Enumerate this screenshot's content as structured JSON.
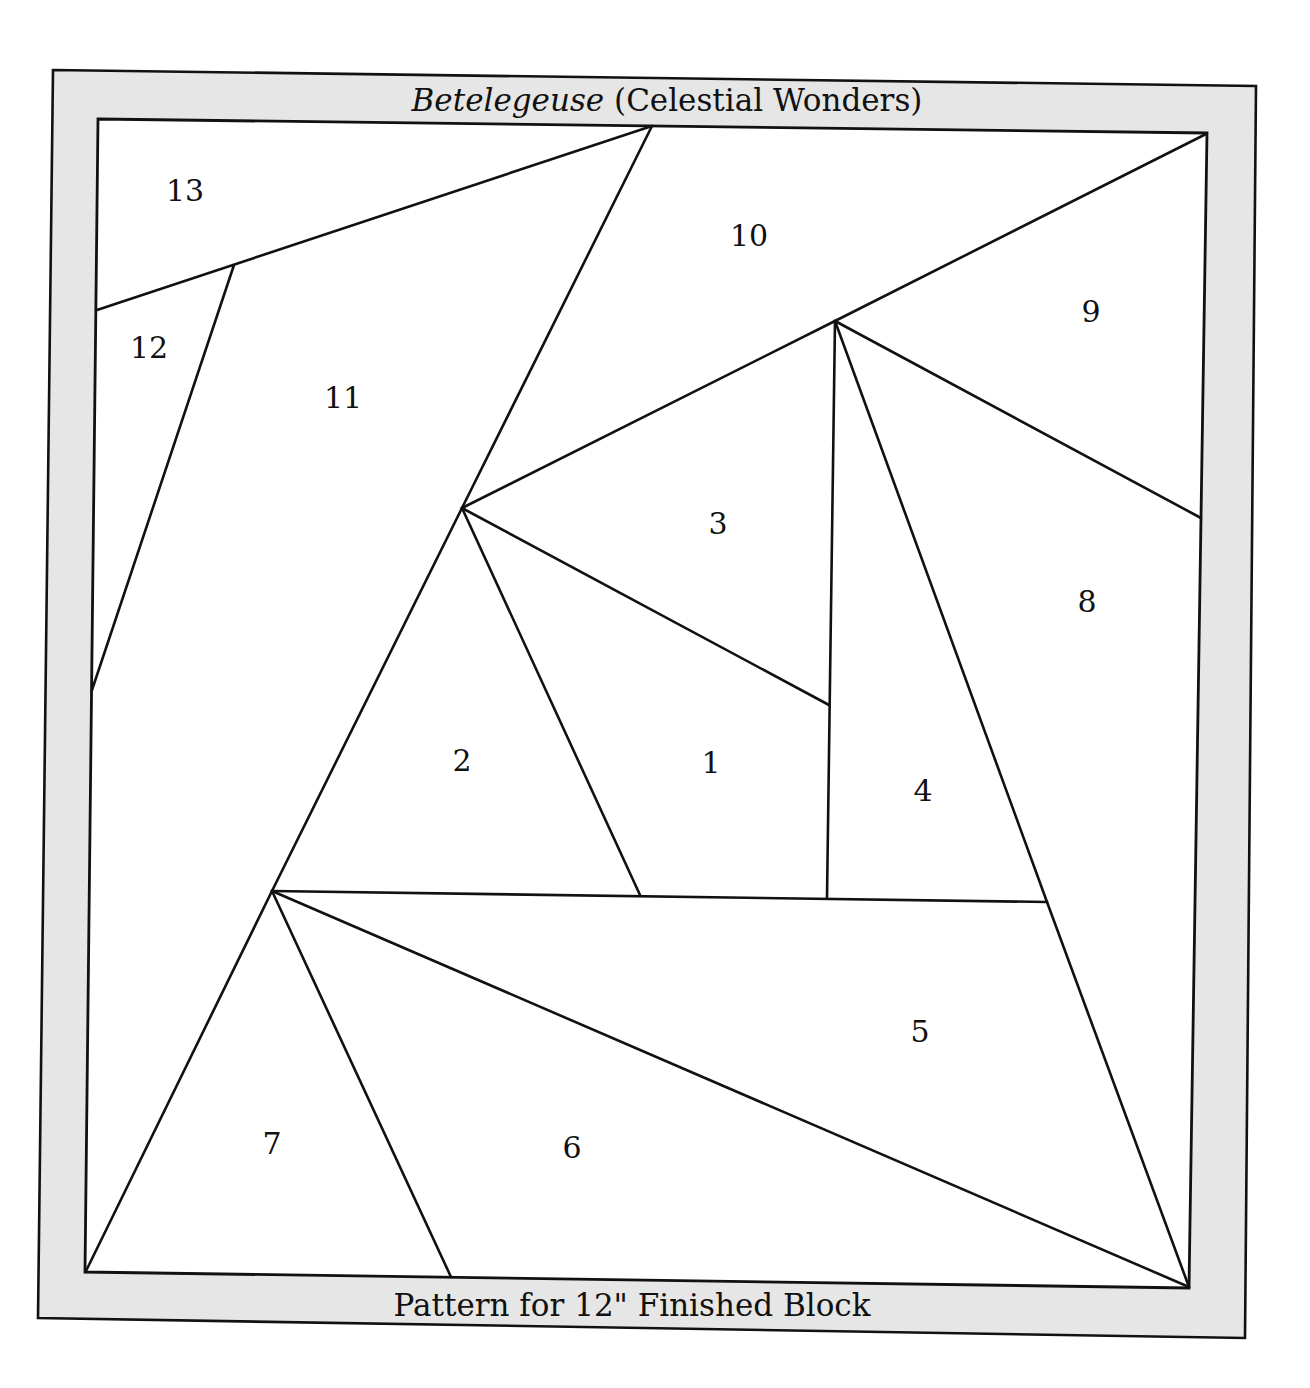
{
  "pattern": {
    "title_italic": "Betelegeuse",
    "title_rest": " (Celestial Wonders)",
    "footer": "Pattern for 12\" Finished Block",
    "colors": {
      "frame_fill": "#e6e6e6",
      "block_fill": "#ffffff",
      "line": "#111111"
    },
    "pieces": [
      {
        "number": "1",
        "x": 711,
        "y": 765
      },
      {
        "number": "2",
        "x": 462,
        "y": 763
      },
      {
        "number": "3",
        "x": 718,
        "y": 526
      },
      {
        "number": "4",
        "x": 923,
        "y": 793
      },
      {
        "number": "5",
        "x": 920,
        "y": 1034
      },
      {
        "number": "6",
        "x": 572,
        "y": 1150
      },
      {
        "number": "7",
        "x": 272,
        "y": 1146
      },
      {
        "number": "8",
        "x": 1087,
        "y": 604
      },
      {
        "number": "9",
        "x": 1091,
        "y": 314
      },
      {
        "number": "10",
        "x": 749,
        "y": 238
      },
      {
        "number": "11",
        "x": 343,
        "y": 400
      },
      {
        "number": "12",
        "x": 149,
        "y": 350
      },
      {
        "number": "13",
        "x": 185,
        "y": 193
      }
    ]
  }
}
